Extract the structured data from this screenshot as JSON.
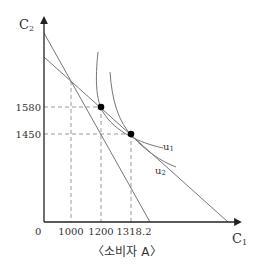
{
  "diagram": {
    "type": "indifference-curve-budget-line",
    "caption": "〈소비자 A〉",
    "axes": {
      "y_label": "C",
      "y_label_sub": "2",
      "x_label": "C",
      "x_label_sub": "1",
      "origin_label": "0"
    },
    "x_ticks": [
      "1000",
      "1200",
      "1318.2"
    ],
    "y_ticks": [
      "1580",
      "1450"
    ],
    "curves": [
      {
        "name": "u",
        "sub": "1"
      },
      {
        "name": "u",
        "sub": "2"
      }
    ],
    "points": [
      {
        "c1": 1200,
        "c2": 1580
      },
      {
        "c1": 1318.2,
        "c2": 1450
      }
    ],
    "budget_lines": [
      {
        "description": "steep budget line",
        "x_intercept_beyond": "1318.2"
      },
      {
        "description": "flatter budget line"
      }
    ],
    "colors": {
      "axis": "#222222",
      "line": "#777777",
      "dash": "#999999",
      "point": "#000000",
      "text": "#333333"
    }
  }
}
